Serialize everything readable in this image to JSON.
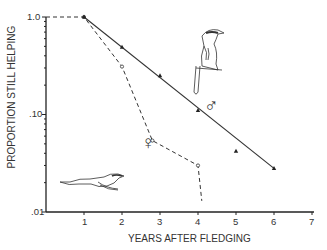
{
  "chart_data": {
    "type": "line",
    "title": "",
    "xlabel": "YEARS AFTER FLEDGING",
    "ylabel": "PROPORTION STILL HELPING",
    "yscale": "log",
    "xlim": [
      0,
      7
    ],
    "ylim": [
      0.01,
      1.0
    ],
    "x_ticks": [
      "1",
      "2",
      "3",
      "4",
      "5",
      "6",
      "7"
    ],
    "y_ticks": [
      "1.0",
      ".10",
      ".01"
    ],
    "grid": false,
    "legend": "none (sex symbols annotate each series)",
    "series": [
      {
        "name": "Males",
        "symbol": "♂",
        "style": "solid line, filled triangle markers",
        "fit_line": {
          "x": [
            1,
            6
          ],
          "y": [
            1.0,
            0.028
          ]
        },
        "x": [
          1,
          2,
          3,
          4,
          5,
          6
        ],
        "y": [
          1.0,
          0.49,
          0.25,
          0.11,
          0.042,
          0.028
        ]
      },
      {
        "name": "Females",
        "symbol": "♀",
        "style": "dashed line, open circle markers",
        "x": [
          0,
          1,
          2,
          2.8,
          4,
          4.1
        ],
        "y": [
          1.0,
          1.0,
          0.31,
          0.054,
          0.03,
          0.013
        ]
      }
    ],
    "annotations": [
      "♂ symbol near male line with standing bird illustration",
      "♀ symbol near female line with flying bird illustration"
    ]
  },
  "axes": {
    "xlabel": "YEARS AFTER FLEDGING",
    "ylabel": "PROPORTION STILL HELPING",
    "y_tick_labels": [
      "1.0",
      ".10",
      ".01"
    ],
    "x_tick_labels": [
      "1",
      "2",
      "3",
      "4",
      "5",
      "6",
      "7"
    ]
  },
  "symbols": {
    "male": "♂",
    "female": "♀"
  }
}
